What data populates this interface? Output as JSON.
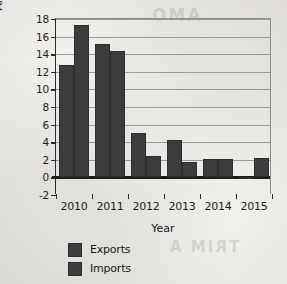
{
  "chart_data": {
    "type": "bar",
    "title": "",
    "xlabel": "Year",
    "ylabel": "Annual growth (%)",
    "categories": [
      "2010",
      "2011",
      "2012",
      "2013",
      "2014",
      "2015"
    ],
    "series": [
      {
        "name": "Exports",
        "values": [
          12.8,
          15.2,
          5.1,
          4.3,
          2.1,
          -0.1
        ]
      },
      {
        "name": "Imports",
        "values": [
          17.3,
          14.4,
          2.4,
          1.8,
          2.1,
          2.2
        ]
      }
    ],
    "ylim": [
      -2,
      18
    ],
    "ytick_values": [
      -2,
      0,
      2,
      4,
      6,
      8,
      10,
      12,
      14,
      16,
      18
    ],
    "ytick_labels": [
      "-2",
      "0",
      "2",
      "4",
      "6",
      "8",
      "10",
      "12",
      "14",
      "16",
      "18"
    ],
    "grid": true,
    "legend_position": "bottom-left",
    "series_color": "#3d3d3d",
    "background_color": "#f1f0ed",
    "axis_color": "#1d1d1d"
  },
  "legend": {
    "items": [
      {
        "label": "Exports"
      },
      {
        "label": "Imports"
      }
    ]
  },
  "page_artifacts": {
    "ghost_top": "AMO",
    "ghost_bottom": "TRIM A"
  }
}
